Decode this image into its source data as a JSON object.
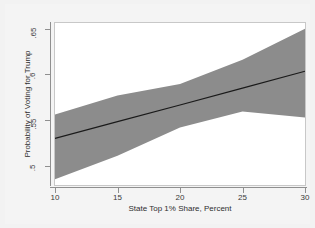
{
  "chart_data": {
    "type": "area",
    "title": "",
    "subtitle": "",
    "xlabel": "State Top 1% Share, Percent",
    "ylabel": "Probability of Voting for Trump",
    "xlim": [
      10,
      30
    ],
    "ylim": [
      0.4792,
      0.6563
    ],
    "xticks": [
      10,
      15,
      20,
      25,
      30
    ],
    "xtick_labels": [
      "10",
      "15",
      "20",
      "25",
      "30"
    ],
    "yticks": [
      0.5,
      0.55,
      0.6,
      0.65
    ],
    "ytick_labels": [
      ".5",
      ".55",
      ".6",
      ".65"
    ],
    "grid": false,
    "legend": "none",
    "x": [
      10,
      15,
      20,
      25,
      30
    ],
    "series": [
      {
        "name": "Predicted probability",
        "type": "line",
        "color": "#1a1a1a",
        "values": [
          0.5301,
          0.5484,
          0.5667,
          0.5851,
          0.6036
        ]
      },
      {
        "name": "95% confidence interval",
        "type": "band",
        "color": "#8c8c8c",
        "lower": [
          0.4854,
          0.5113,
          0.542,
          0.5596,
          0.5531
        ],
        "upper": [
          0.5563,
          0.5771,
          0.5897,
          0.6161,
          0.65
        ]
      }
    ]
  },
  "axes": {
    "y_title": "Probability of Voting for Trump",
    "x_title": "State Top 1% Share, Percent"
  },
  "colors": {
    "band": "#8c8c8c",
    "line": "#1a1a1a",
    "plot_background": "#ffffff",
    "figure_background": "#f4f4f4",
    "axis": "#8f8f8f",
    "text": "#2e2e2e"
  }
}
